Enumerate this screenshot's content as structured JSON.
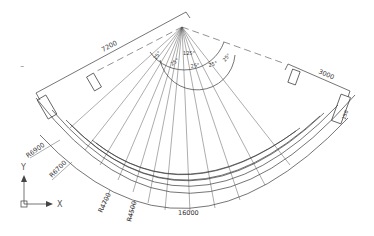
{
  "drawing": {
    "type": "CAD plan view",
    "dimensions": {
      "top_left_length": "7200",
      "top_right_length": "3000",
      "bottom_arc_length": "16000",
      "right_small_dim": "150"
    },
    "angles": {
      "total": "125°",
      "segments": [
        "25°",
        "25°",
        "25°",
        "25°",
        "25°"
      ]
    },
    "radii": [
      {
        "label": "R6900"
      },
      {
        "label": "R6700"
      },
      {
        "label": "R4700"
      },
      {
        "label": "R4500"
      }
    ],
    "ucs": {
      "x_label": "X",
      "y_label": "Y"
    },
    "stray_mark": "~"
  },
  "colors": {
    "line": "#3a3a3a",
    "background": "#ffffff"
  }
}
